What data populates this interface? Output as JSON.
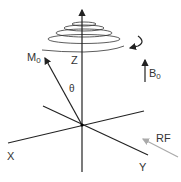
{
  "diagram": {
    "labels": {
      "m0_main": "M",
      "m0_sub": "0",
      "z_axis": "Z",
      "theta": "θ",
      "b0_main": "B",
      "b0_sub": "0",
      "x_axis": "X",
      "y_axis": "Y",
      "rf": "RF"
    },
    "colors": {
      "lines": "#222222",
      "rf_arrow": "#aaaaaa",
      "text": "#333333"
    }
  }
}
